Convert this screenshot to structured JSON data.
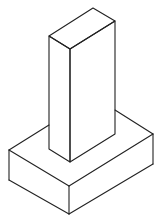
{
  "figure": {
    "stroke_color": "#222222",
    "background": "#ffffff",
    "column": {
      "top_face": [
        [
          93,
          8
        ],
        [
          115,
          21
        ],
        [
          70,
          49
        ],
        [
          49,
          36
        ]
      ],
      "front_left_face": [
        [
          49,
          36
        ],
        [
          70,
          49
        ],
        [
          70,
          162
        ],
        [
          49,
          149
        ]
      ],
      "front_right_face": [
        [
          70,
          49
        ],
        [
          115,
          21
        ],
        [
          115,
          134
        ],
        [
          70,
          162
        ]
      ]
    },
    "base": {
      "top_left_edge_back": [
        [
          9,
          150
        ],
        [
          49,
          125
        ]
      ],
      "top_right_edge_back": [
        [
          115,
          110
        ],
        [
          153,
          134
        ]
      ],
      "top_front_left_edge": [
        [
          9,
          150
        ],
        [
          69,
          186
        ]
      ],
      "top_front_right_edge": [
        [
          69,
          186
        ],
        [
          153,
          134
        ]
      ],
      "left_vertical": [
        [
          9,
          150
        ],
        [
          9,
          180
        ]
      ],
      "front_vertical": [
        [
          69,
          186
        ],
        [
          69,
          214
        ]
      ],
      "right_vertical": [
        [
          153,
          134
        ],
        [
          153,
          164
        ]
      ],
      "bottom_front_left_edge": [
        [
          9,
          180
        ],
        [
          69,
          214
        ]
      ],
      "bottom_front_right_edge": [
        [
          69,
          214
        ],
        [
          153,
          164
        ]
      ]
    }
  }
}
